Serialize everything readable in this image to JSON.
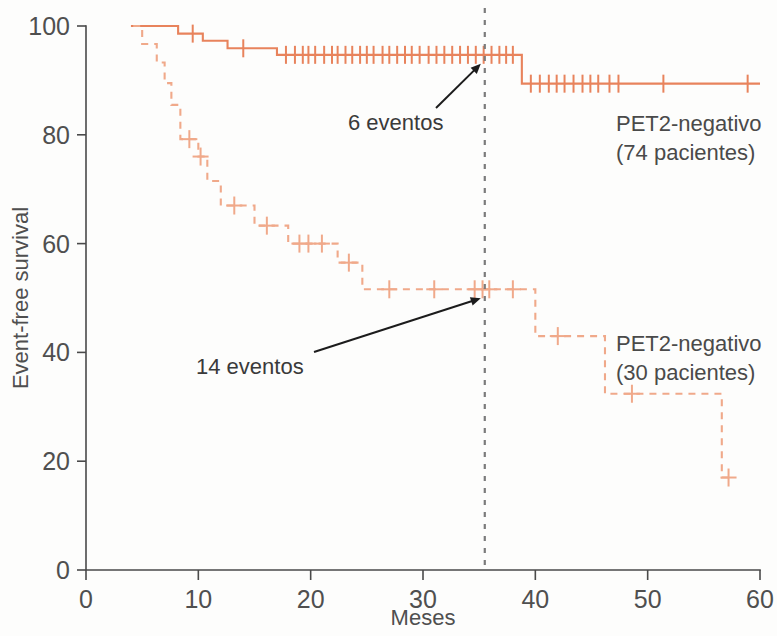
{
  "figure": {
    "background_color": "#fdfdfc",
    "curve_color": "#e8835c",
    "curve_color_light": "#f0a98a",
    "axis_color": "#4a4a4a",
    "refline_color": "#7b7b7b"
  },
  "axes": {
    "x": {
      "label": "Meses",
      "ticks": [
        0,
        10,
        20,
        30,
        40,
        50,
        60
      ],
      "tick_labels": [
        "0",
        "10",
        "20",
        "30",
        "40",
        "50",
        "60"
      ],
      "min": 0,
      "max": 60
    },
    "y": {
      "label": "Event-free survival",
      "ticks": [
        0,
        20,
        40,
        60,
        80,
        100
      ],
      "tick_labels": [
        "0",
        "20",
        "40",
        "60",
        "80",
        "100"
      ],
      "min": 0,
      "max": 100
    }
  },
  "reference_line": {
    "x_value": 35.5,
    "style": "dashed",
    "color": "#7b7b7b"
  },
  "annotations": [
    {
      "text": "6 eventos",
      "x_text": 348,
      "y_text": 130,
      "points_to_x": 35.5,
      "points_to_y": 94.7
    },
    {
      "text": "14 eventos",
      "x_text": 196,
      "y_text": 374,
      "points_to_x": 35.5,
      "points_to_y": 51.6
    }
  ],
  "legends": [
    {
      "line1": "PET2-negativo",
      "line2": "(74 pacientes)",
      "x": 616,
      "y": 131
    },
    {
      "line1": "PET2-negativo",
      "line2": "(30 pacientes)",
      "x": 616,
      "y": 351
    }
  ],
  "chart_data": {
    "type": "line",
    "subtype": "kaplan-meier-survival",
    "title": "",
    "xlabel": "Meses",
    "ylabel": "Event-free survival",
    "xlim": [
      0,
      60
    ],
    "ylim": [
      0,
      100
    ],
    "grid": false,
    "legend_position": "right-inside",
    "series": [
      {
        "name": "PET2-negativo (74 pacientes)",
        "label_line1": "PET2-negativo",
        "label_line2": "(74 pacientes)",
        "n_patients": 74,
        "events": 6,
        "linestyle": "solid",
        "color": "#e8835c",
        "steps": [
          [
            4.0,
            100.0
          ],
          [
            8.2,
            100.0
          ],
          [
            8.2,
            98.6
          ],
          [
            10.4,
            98.6
          ],
          [
            10.4,
            97.3
          ],
          [
            12.6,
            97.3
          ],
          [
            12.6,
            95.9
          ],
          [
            17.0,
            95.9
          ],
          [
            17.0,
            94.7
          ],
          [
            38.8,
            94.7
          ],
          [
            38.8,
            89.4
          ],
          [
            60.0,
            89.4
          ]
        ],
        "censor_times": [
          9.5,
          14.0,
          17.8,
          18.6,
          19.3,
          19.8,
          20.4,
          21.2,
          21.9,
          22.4,
          23.1,
          23.7,
          24.4,
          25.0,
          25.6,
          26.4,
          27.0,
          27.7,
          28.4,
          29.0,
          29.7,
          30.5,
          31.2,
          31.9,
          32.6,
          33.3,
          34.0,
          34.7,
          35.4,
          36.1,
          36.8,
          37.4,
          38.0,
          39.6,
          40.4,
          41.2,
          41.9,
          42.6,
          43.4,
          44.2,
          44.9,
          45.6,
          46.6,
          47.4,
          51.4,
          58.9
        ]
      },
      {
        "name": "PET2-negativo (30 pacientes)",
        "label_line1": "PET2-negativo",
        "label_line2": "(30 pacientes)",
        "n_patients": 30,
        "events": 14,
        "linestyle": "dashed",
        "color": "#f0a98a",
        "steps": [
          [
            4.2,
            100.0
          ],
          [
            5.0,
            100.0
          ],
          [
            5.0,
            96.7
          ],
          [
            6.3,
            96.7
          ],
          [
            6.3,
            93.3
          ],
          [
            7.0,
            93.3
          ],
          [
            7.0,
            89.5
          ],
          [
            7.6,
            89.5
          ],
          [
            7.6,
            85.5
          ],
          [
            8.4,
            85.5
          ],
          [
            8.4,
            79.2
          ],
          [
            10.0,
            79.2
          ],
          [
            10.0,
            76.0
          ],
          [
            10.8,
            76.0
          ],
          [
            10.8,
            71.5
          ],
          [
            12.0,
            71.5
          ],
          [
            12.0,
            67.0
          ],
          [
            15.0,
            67.0
          ],
          [
            15.0,
            63.3
          ],
          [
            18.0,
            63.3
          ],
          [
            18.0,
            60.0
          ],
          [
            22.4,
            60.0
          ],
          [
            22.4,
            56.5
          ],
          [
            24.6,
            56.5
          ],
          [
            24.6,
            51.6
          ],
          [
            40.0,
            51.6
          ],
          [
            40.0,
            43.0
          ],
          [
            46.2,
            43.0
          ],
          [
            46.2,
            32.4
          ],
          [
            56.6,
            32.4
          ],
          [
            56.6,
            17.0
          ],
          [
            57.2,
            17.0
          ]
        ],
        "censor_times": [
          9.2,
          10.2,
          13.2,
          16.1,
          19.0,
          19.8,
          21.0,
          23.4,
          27.0,
          31.0,
          34.6,
          35.3,
          35.9,
          38.0,
          42.0,
          48.6,
          57.2
        ]
      }
    ]
  }
}
